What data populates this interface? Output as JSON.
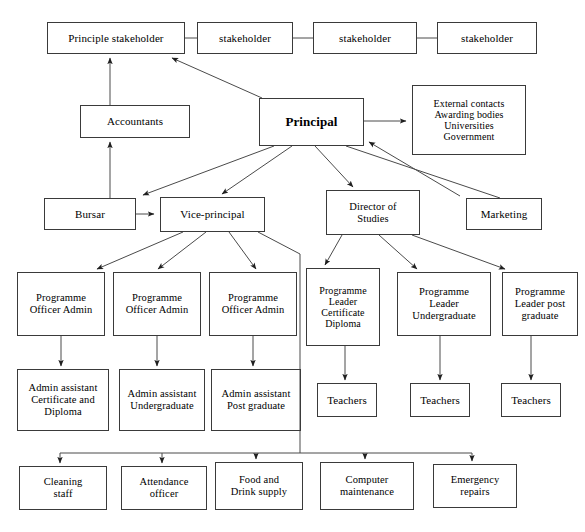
{
  "diagram": {
    "type": "org-chart",
    "canvas": {
      "width": 585,
      "height": 532
    },
    "style": {
      "box_border_color": "#3a3a3a",
      "line_color": "#4a4a4a",
      "text_color": "#000000",
      "background": "#ffffff"
    },
    "nodes": [
      {
        "id": "principle-stakeholder",
        "label": "Principle stakeholder",
        "x": 47,
        "y": 22,
        "w": 138,
        "h": 32,
        "emphasis": false
      },
      {
        "id": "stakeholder-1",
        "label": "stakeholder",
        "x": 197,
        "y": 22,
        "w": 96,
        "h": 32,
        "emphasis": false
      },
      {
        "id": "stakeholder-2",
        "label": "stakeholder",
        "x": 313,
        "y": 22,
        "w": 104,
        "h": 32,
        "emphasis": false
      },
      {
        "id": "stakeholder-3",
        "label": "stakeholder",
        "x": 437,
        "y": 22,
        "w": 100,
        "h": 32,
        "emphasis": false
      },
      {
        "id": "accountants",
        "label": "Accountants",
        "x": 80,
        "y": 105,
        "w": 110,
        "h": 33,
        "emphasis": false
      },
      {
        "id": "principal",
        "label": "Principal",
        "x": 259,
        "y": 98,
        "w": 105,
        "h": 48,
        "emphasis": true
      },
      {
        "id": "external-contacts",
        "label": "External contacts\nAwarding bodies\nUniversities\nGovernment",
        "x": 412,
        "y": 85,
        "w": 114,
        "h": 70,
        "emphasis": false
      },
      {
        "id": "bursar",
        "label": "Bursar",
        "x": 44,
        "y": 198,
        "w": 92,
        "h": 32,
        "emphasis": false
      },
      {
        "id": "vice-principal",
        "label": "Vice-principal",
        "x": 160,
        "y": 197,
        "w": 105,
        "h": 35,
        "emphasis": false
      },
      {
        "id": "director-of-studies",
        "label": "Director of\nStudies",
        "x": 326,
        "y": 190,
        "w": 94,
        "h": 45,
        "emphasis": false
      },
      {
        "id": "marketing",
        "label": "Marketing",
        "x": 466,
        "y": 198,
        "w": 76,
        "h": 32,
        "emphasis": false
      },
      {
        "id": "programme-officer-admin-1",
        "label": "Programme\nOfficer Admin",
        "x": 17,
        "y": 272,
        "w": 88,
        "h": 64,
        "emphasis": false
      },
      {
        "id": "programme-officer-admin-2",
        "label": "Programme\nOfficer Admin",
        "x": 113,
        "y": 272,
        "w": 88,
        "h": 64,
        "emphasis": false
      },
      {
        "id": "programme-officer-admin-3",
        "label": "Programme\nOfficer Admin",
        "x": 209,
        "y": 272,
        "w": 88,
        "h": 64,
        "emphasis": false
      },
      {
        "id": "programme-leader-certificate-diploma",
        "label": "Programme\nLeader\nCertificate\nDiploma",
        "x": 306,
        "y": 268,
        "w": 74,
        "h": 78,
        "emphasis": false
      },
      {
        "id": "programme-leader-undergraduate",
        "label": "Programme\nLeader\nUndergraduate",
        "x": 397,
        "y": 272,
        "w": 94,
        "h": 64,
        "emphasis": false
      },
      {
        "id": "programme-leader-post-graduate",
        "label": "Programme\nLeader post\ngraduate",
        "x": 502,
        "y": 272,
        "w": 76,
        "h": 64,
        "emphasis": false
      },
      {
        "id": "admin-assistant-certificate-diploma",
        "label": "Admin assistant\nCertificate and\nDiploma",
        "x": 17,
        "y": 369,
        "w": 92,
        "h": 62,
        "emphasis": false
      },
      {
        "id": "admin-assistant-undergraduate",
        "label": "Admin assistant\nUndergraduate",
        "x": 119,
        "y": 369,
        "w": 86,
        "h": 62,
        "emphasis": false
      },
      {
        "id": "admin-assistant-post-graduate",
        "label": "Admin assistant\nPost graduate",
        "x": 211,
        "y": 369,
        "w": 90,
        "h": 62,
        "emphasis": false
      },
      {
        "id": "teachers-1",
        "label": "Teachers",
        "x": 317,
        "y": 383,
        "w": 60,
        "h": 34,
        "emphasis": false
      },
      {
        "id": "teachers-2",
        "label": "Teachers",
        "x": 410,
        "y": 383,
        "w": 60,
        "h": 34,
        "emphasis": false
      },
      {
        "id": "teachers-3",
        "label": "Teachers",
        "x": 501,
        "y": 383,
        "w": 60,
        "h": 34,
        "emphasis": false
      },
      {
        "id": "cleaning-staff",
        "label": "Cleaning\nstaff",
        "x": 19,
        "y": 466,
        "w": 88,
        "h": 44,
        "emphasis": false
      },
      {
        "id": "attendance-officer",
        "label": "Attendance\nofficer",
        "x": 121,
        "y": 466,
        "w": 86,
        "h": 44,
        "emphasis": false
      },
      {
        "id": "food-and-drink-supply",
        "label": "Food and\nDrink supply",
        "x": 215,
        "y": 462,
        "w": 88,
        "h": 48,
        "emphasis": false
      },
      {
        "id": "computer-maintenance",
        "label": "Computer\nmaintenance",
        "x": 320,
        "y": 462,
        "w": 94,
        "h": 48,
        "emphasis": false
      },
      {
        "id": "emergency-repairs",
        "label": "Emergency\nrepairs",
        "x": 433,
        "y": 464,
        "w": 84,
        "h": 44,
        "emphasis": false
      }
    ],
    "edges": [
      {
        "id": "edge-principle-stakeholder-1",
        "from": "principle-stakeholder",
        "to": "stakeholder-1",
        "kind": "plain"
      },
      {
        "id": "edge-stakeholder-1-2",
        "from": "stakeholder-1",
        "to": "stakeholder-2",
        "kind": "plain"
      },
      {
        "id": "edge-stakeholder-2-3",
        "from": "stakeholder-2",
        "to": "stakeholder-3",
        "kind": "plain"
      },
      {
        "id": "edge-accountants-to-principle-stakeholder",
        "from": "accountants",
        "to": "principle-stakeholder",
        "kind": "arrow"
      },
      {
        "id": "edge-bursar-to-accountants",
        "from": "bursar",
        "to": "accountants",
        "kind": "arrow"
      },
      {
        "id": "edge-principal-to-principle-stakeholder",
        "from": "principal",
        "to": "principle-stakeholder",
        "kind": "arrow"
      },
      {
        "id": "edge-principal-to-external-contacts",
        "from": "principal",
        "to": "external-contacts",
        "kind": "arrow"
      },
      {
        "id": "edge-external-contacts-to-principal",
        "from": "external-contacts",
        "to": "principal",
        "kind": "arrow"
      },
      {
        "id": "edge-principal-to-bursar",
        "from": "principal",
        "to": "bursar",
        "kind": "arrow"
      },
      {
        "id": "edge-principal-to-vice-principal",
        "from": "principal",
        "to": "vice-principal",
        "kind": "arrow"
      },
      {
        "id": "edge-principal-to-director-of-studies",
        "from": "principal",
        "to": "director-of-studies",
        "kind": "arrow"
      },
      {
        "id": "edge-principal-to-marketing",
        "from": "principal",
        "to": "marketing",
        "kind": "plain"
      },
      {
        "id": "edge-bursar-to-vice-principal",
        "from": "bursar",
        "to": "vice-principal",
        "kind": "arrow"
      },
      {
        "id": "edge-vice-principal-to-poa-1",
        "from": "vice-principal",
        "to": "programme-officer-admin-1",
        "kind": "arrow"
      },
      {
        "id": "edge-vice-principal-to-poa-2",
        "from": "vice-principal",
        "to": "programme-officer-admin-2",
        "kind": "arrow"
      },
      {
        "id": "edge-vice-principal-to-poa-3",
        "from": "vice-principal",
        "to": "programme-officer-admin-3",
        "kind": "arrow"
      },
      {
        "id": "edge-vice-principal-to-support-bus",
        "from": "vice-principal",
        "to": "support-services-bus",
        "kind": "plain"
      },
      {
        "id": "edge-director-to-pl-certificate",
        "from": "director-of-studies",
        "to": "programme-leader-certificate-diploma",
        "kind": "arrow"
      },
      {
        "id": "edge-director-to-pl-undergraduate",
        "from": "director-of-studies",
        "to": "programme-leader-undergraduate",
        "kind": "arrow"
      },
      {
        "id": "edge-director-to-pl-post-graduate",
        "from": "director-of-studies",
        "to": "programme-leader-post-graduate",
        "kind": "arrow"
      },
      {
        "id": "edge-poa-1-to-admin-assistant-1",
        "from": "programme-officer-admin-1",
        "to": "admin-assistant-certificate-diploma",
        "kind": "arrow"
      },
      {
        "id": "edge-poa-2-to-admin-assistant-2",
        "from": "programme-officer-admin-2",
        "to": "admin-assistant-undergraduate",
        "kind": "arrow"
      },
      {
        "id": "edge-poa-3-to-admin-assistant-3",
        "from": "programme-officer-admin-3",
        "to": "admin-assistant-post-graduate",
        "kind": "arrow"
      },
      {
        "id": "edge-pl-certificate-to-teachers-1",
        "from": "programme-leader-certificate-diploma",
        "to": "teachers-1",
        "kind": "arrow"
      },
      {
        "id": "edge-pl-undergraduate-to-teachers-2",
        "from": "programme-leader-undergraduate",
        "to": "teachers-2",
        "kind": "arrow"
      },
      {
        "id": "edge-pl-post-graduate-to-teachers-3",
        "from": "programme-leader-post-graduate",
        "to": "teachers-3",
        "kind": "arrow"
      },
      {
        "id": "edge-bus-to-cleaning-staff",
        "from": "support-services-bus",
        "to": "cleaning-staff",
        "kind": "arrow"
      },
      {
        "id": "edge-bus-to-attendance-officer",
        "from": "support-services-bus",
        "to": "attendance-officer",
        "kind": "arrow"
      },
      {
        "id": "edge-bus-to-food-and-drink-supply",
        "from": "support-services-bus",
        "to": "food-and-drink-supply",
        "kind": "arrow"
      },
      {
        "id": "edge-bus-to-computer-maintenance",
        "from": "support-services-bus",
        "to": "computer-maintenance",
        "kind": "arrow"
      },
      {
        "id": "edge-bus-to-emergency-repairs",
        "from": "support-services-bus",
        "to": "emergency-repairs",
        "kind": "arrow"
      }
    ]
  }
}
